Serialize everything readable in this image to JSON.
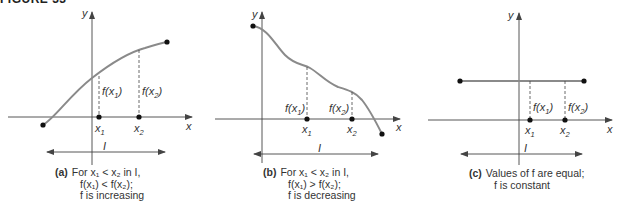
{
  "header": {
    "title": "FIGURE 33"
  },
  "panels": [
    {
      "id": "a",
      "tag": "(a)",
      "caption_lines": [
        "For x₁ < x₂ in I,",
        "f(x₁) < f(x₂);",
        "f is increasing"
      ],
      "labels": {
        "y_axis": "y",
        "x_axis": "x",
        "x1": "x",
        "x1_sub": "1",
        "x2": "x",
        "x2_sub": "2",
        "fx1": "f(x",
        "fx1_sub": "1",
        "fx1_close": ")",
        "fx2": "f(x",
        "fx2_sub": "2",
        "fx2_close": ")",
        "interval": "I"
      },
      "behavior": "increasing"
    },
    {
      "id": "b",
      "tag": "(b)",
      "caption_lines": [
        "For x₁ < x₂ in I,",
        "f(x₁) > f(x₂);",
        "f is decreasing"
      ],
      "labels": {
        "y_axis": "y",
        "x_axis": "x",
        "x1": "x",
        "x1_sub": "1",
        "x2": "x",
        "x2_sub": "2",
        "fx1": "f(x",
        "fx1_sub": "1",
        "fx1_close": ")",
        "fx2": "f(x",
        "fx2_sub": "2",
        "fx2_close": ")",
        "interval": "I"
      },
      "behavior": "decreasing"
    },
    {
      "id": "c",
      "tag": "(c)",
      "caption_lines": [
        "Values of f are equal;",
        "f is constant"
      ],
      "labels": {
        "y_axis": "y",
        "x_axis": "x",
        "x1": "x",
        "x1_sub": "1",
        "x2": "x",
        "x2_sub": "2",
        "fx1": "f(x",
        "fx1_sub": "1",
        "fx1_close": ")",
        "fx2": "f(x",
        "fx2_sub": "2",
        "fx2_close": ")",
        "interval": "I"
      },
      "behavior": "constant"
    }
  ],
  "colors": {
    "curve": "#8a8a8a",
    "axis": "#444444",
    "dot": "#111111",
    "text": "#333333"
  }
}
